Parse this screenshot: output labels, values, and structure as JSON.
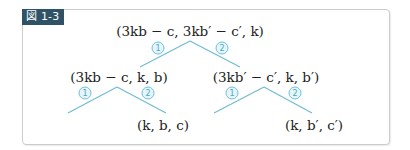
{
  "figure": {
    "label": "図 1-3",
    "colors": {
      "label_bg": "#2f5266",
      "line": "#6fbcd3",
      "circle_border": "#6fc1d6",
      "circle_text": "#4aa9c4",
      "frame_border": "#c9cdd0"
    }
  },
  "tree": {
    "root": {
      "text": "(3kb − c, 3kb′ − c′, k)"
    },
    "root_branches": {
      "left": "1",
      "right": "2"
    },
    "left_child": {
      "text": "(3kb − c, k,  b)"
    },
    "left_branches": {
      "left": "1",
      "right": "2"
    },
    "left_leaf": {
      "text": "(k, b, c)"
    },
    "right_child": {
      "text": "(3kb′ − c′, k,  b′)"
    },
    "right_branches": {
      "left": "1",
      "right": "2"
    },
    "right_leaf": {
      "text": "(k, b′, c′)"
    }
  }
}
